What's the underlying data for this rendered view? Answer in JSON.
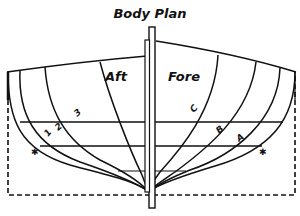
{
  "title": "Body Plan",
  "sides": {
    "aft": "Aft",
    "fore": "Fore"
  },
  "aft_sections": [
    {
      "label": "3"
    },
    {
      "label": "2"
    },
    {
      "label": "1"
    },
    {
      "label": "✱"
    }
  ],
  "fore_sections": [
    {
      "label": "C"
    },
    {
      "label": "B"
    },
    {
      "label": "A"
    },
    {
      "label": "✱"
    }
  ],
  "colors": {
    "ink": "#111111",
    "paper": "#ffffff"
  }
}
